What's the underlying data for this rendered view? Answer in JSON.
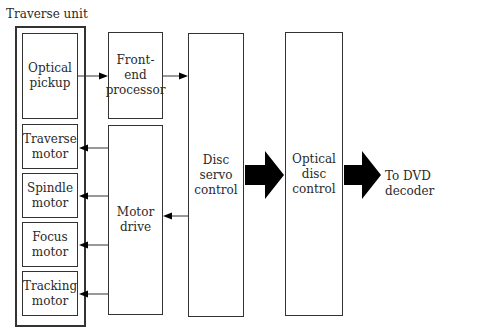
{
  "diagram": {
    "group_label": "Traverse unit",
    "blocks": {
      "optical_pickup": "Optical\npickup",
      "traverse_motor": "Traverse\nmotor",
      "spindle_motor": "Spindle\nmotor",
      "focus_motor": "Focus\nmotor",
      "tracking_motor": "Tracking\nmotor",
      "front_end_processor": "Front-end\nprocessor",
      "motor_drive": "Motor\ndrive",
      "disc_servo_control": "Disc\nservo\ncontrol",
      "optical_disc_control": "Optical\ndisc\ncontrol"
    },
    "output_label": "To DVD decoder",
    "colors": {
      "line": "#333333",
      "arrow_fill": "#000000"
    }
  }
}
